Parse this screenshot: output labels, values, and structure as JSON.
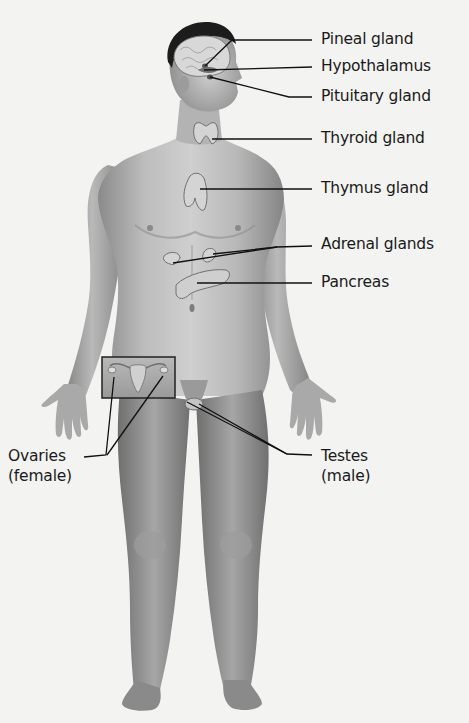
{
  "diagram": {
    "colors": {
      "background": "#f3f3f1",
      "skin_light": "#c9c9c9",
      "skin_mid": "#a8a8a8",
      "skin_dark": "#7d7d7d",
      "hair": "#1c1c1c",
      "gland_fill": "#d6d6d6",
      "gland_stroke": "#6a6a6a",
      "leader_line": "#111111",
      "label_text": "#1a1a1a"
    },
    "labels": [
      {
        "id": "pineal",
        "text": "Pineal gland"
      },
      {
        "id": "hypothalamus",
        "text": "Hypothalamus"
      },
      {
        "id": "pituitary",
        "text": "Pituitary gland"
      },
      {
        "id": "thyroid",
        "text": "Thyroid gland"
      },
      {
        "id": "thymus",
        "text": "Thymus gland"
      },
      {
        "id": "adrenal",
        "text": "Adrenal glands"
      },
      {
        "id": "pancreas",
        "text": "Pancreas"
      },
      {
        "id": "ovaries",
        "line1": "Ovaries",
        "line2": "(female)"
      },
      {
        "id": "testes",
        "line1": "Testes",
        "line2": "(male)"
      }
    ]
  }
}
